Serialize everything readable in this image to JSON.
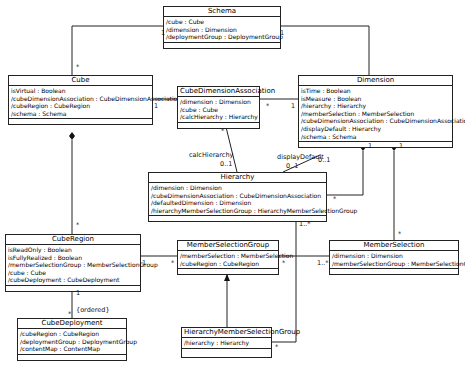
{
  "classes": {
    "schema": {
      "name": "Schema",
      "attrs": [
        "/cube : Cube",
        "/dimension : Dimension",
        "/deploymentGroup : DeploymentGroup"
      ]
    },
    "cube": {
      "name": "Cube",
      "attrs": [
        "isVirtual : Boolean",
        "/cubeDimensionAssociation : CubeDimensionAssociation",
        "/cubeRegion : CubeRegion",
        "/schema : Schema"
      ]
    },
    "cda": {
      "name": "CubeDimensionAssociation",
      "attrs": [
        "/dimension : Dimension",
        "/cube : Cube",
        "/calcHierarchy : Hierarchy"
      ]
    },
    "dimension": {
      "name": "Dimension",
      "attrs": [
        "isTime : Boolean",
        "isMeasure : Boolean",
        "/hierarchy : Hierarchy",
        "/memberSelection : MemberSelection",
        "/cubeDimensionAssociation : CubeDimensionAssociation",
        "/displayDefault : Hierarchy",
        "/schema : Schema"
      ]
    },
    "hierarchy": {
      "name": "Hierarchy",
      "attrs": [
        "/dimension : Dimension",
        "/cubeDimensionAssociation : CubeDimensionAssociation",
        "/defaultedDimension : Dimension",
        "/hierarchyMemberSelectionGroup : HierarchyMemberSelectionGroup"
      ]
    },
    "cubeRegion": {
      "name": "CubeRegion",
      "attrs": [
        "isReadOnly : Boolean",
        "isFullyRealized : Boolean",
        "/memberSelectionGroup : MemberSelectionGroup",
        "/cube : Cube",
        "/cubeDeployment : CubeDeployment"
      ]
    },
    "msg": {
      "name": "MemberSelectionGroup",
      "attrs": [
        "/memberSelection : MemberSelection",
        "/cubeRegion : CubeRegion"
      ]
    },
    "memberSelection": {
      "name": "MemberSelection",
      "attrs": [
        "/dimension : Dimension",
        "/memberSelectionGroup : MemberSelectionGroup"
      ]
    },
    "cubeDeployment": {
      "name": "CubeDeployment",
      "attrs": [
        "/cubeRegion : CubeRegion",
        "/deploymentGroup : DeploymentGroup",
        "/contentMap : ContentMap"
      ]
    },
    "hmsg": {
      "name": "HierarchyMemberSelectionGroup",
      "attrs": [
        "/hierarchy : Hierarchy"
      ]
    }
  },
  "labels": {
    "schema_cube_1": "1",
    "schema_cube_many": "*",
    "schema_dim_1": "1",
    "schema_dim_many": "*",
    "cube_cda_1": "1",
    "cda_dim_many": "*",
    "cda_dim_1": "1",
    "calcHierarchy": "calcHierarchy",
    "calc_01": "0..1",
    "calc_many": "*",
    "displayDefault": "displayDefault",
    "dd_01_top": "0..1",
    "dd_01_bottom": "0..1",
    "dim_hier_1": "1",
    "dim_hier_many": "*",
    "dim_ms_1": "1",
    "dim_ms_many": "*",
    "cube_cr_many": "*",
    "cr_msg_1": "1",
    "cr_msg_many": "*",
    "msg_ms_many": "*",
    "msg_ms_1n": "1..*",
    "hier_hmsg_1n": "1..*",
    "hier_hmsg_many": "*",
    "cr_cd_1": "1",
    "cr_cd_many": "*",
    "ordered": "{ordered}"
  }
}
